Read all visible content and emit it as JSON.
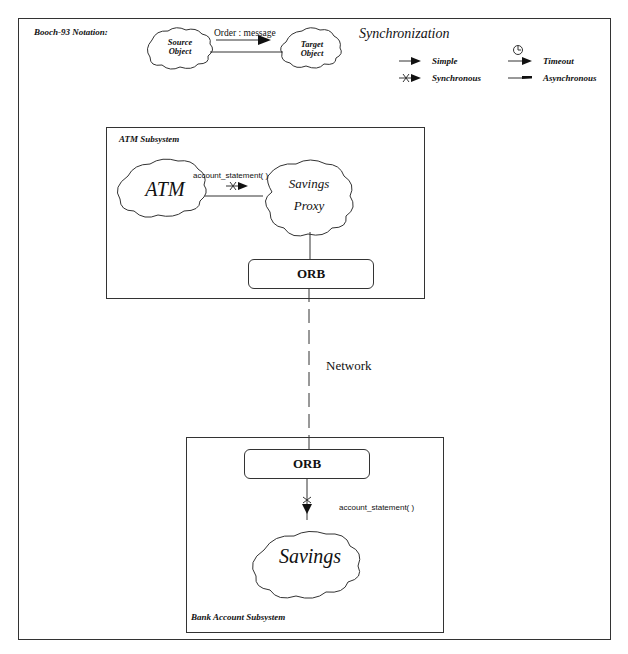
{
  "notation": {
    "title": "Booch-93 Notation:",
    "source_object": [
      "Source",
      "Object"
    ],
    "target_object": [
      "Target",
      "Object"
    ],
    "message_label": "Order : message"
  },
  "synchronization": {
    "title": "Synchronization",
    "items": [
      {
        "label": "Simple",
        "icon": "simple-arrow-icon"
      },
      {
        "label": "Timeout",
        "icon": "timeout-arrow-icon"
      },
      {
        "label": "Synchronous",
        "icon": "synchronous-arrow-icon"
      },
      {
        "label": "Asynchronous",
        "icon": "asynchronous-arrow-icon"
      }
    ]
  },
  "atm_subsystem": {
    "title": "ATM Subsystem",
    "atm_object": "ATM",
    "proxy_object": [
      "Savings",
      "Proxy"
    ],
    "message": "account_statement( )",
    "orb_label": "ORB"
  },
  "network": {
    "label": "Network"
  },
  "bank_subsystem": {
    "title": "Bank Account Subsystem",
    "orb_label": "ORB",
    "message": "account_statement( )",
    "savings_object": "Savings"
  },
  "colors": {
    "line": "#333333",
    "background": "#ffffff",
    "text": "#111111"
  }
}
